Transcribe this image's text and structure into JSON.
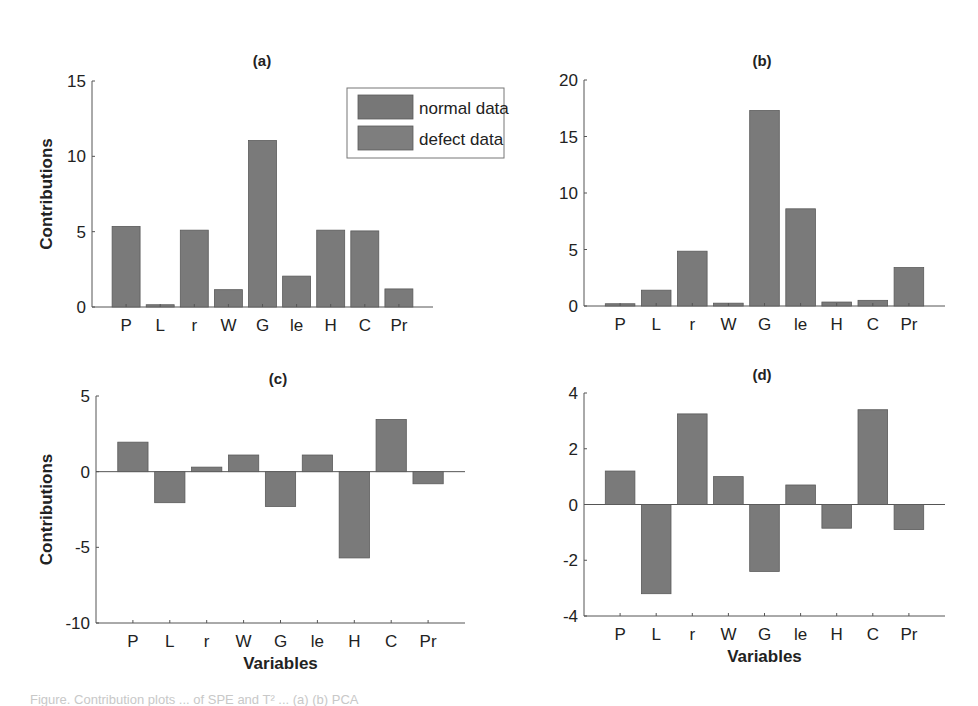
{
  "figure": {
    "bar_color": "#7a7a7a",
    "bar_edge": "#5a5a5a",
    "axis_color": "#555555",
    "caption_partial": "Figure. Contribution plots ... of SPE and T² ... (a) (b) PCA"
  },
  "legend": {
    "items": [
      {
        "label": "normal data",
        "color": "#777777"
      },
      {
        "label": "defect data",
        "color": "#7e7e7e"
      }
    ]
  },
  "chart_data": [
    {
      "type": "bar",
      "title": "(a)",
      "xlabel": "",
      "ylabel": "Contributions",
      "categories": [
        "P",
        "L",
        "r",
        "W",
        "G",
        "le",
        "H",
        "C",
        "Pr"
      ],
      "values": [
        5.35,
        0.15,
        5.1,
        1.15,
        11.05,
        2.05,
        5.1,
        5.05,
        1.2
      ],
      "ylim": [
        0,
        15
      ],
      "yticks": [
        0,
        5,
        10,
        15
      ],
      "grid": false,
      "legend": [
        "normal data",
        "defect data"
      ],
      "legend_position": "upper right"
    },
    {
      "type": "bar",
      "title": "(b)",
      "xlabel": "",
      "ylabel": "",
      "categories": [
        "P",
        "L",
        "r",
        "W",
        "G",
        "le",
        "H",
        "C",
        "Pr"
      ],
      "values": [
        0.2,
        1.4,
        4.85,
        0.25,
        17.3,
        8.6,
        0.35,
        0.5,
        3.4
      ],
      "ylim": [
        0,
        20
      ],
      "yticks": [
        0,
        5,
        10,
        15,
        20
      ],
      "grid": false
    },
    {
      "type": "bar",
      "title": "(c)",
      "xlabel": "Variables",
      "ylabel": "Contributions",
      "categories": [
        "P",
        "L",
        "r",
        "W",
        "G",
        "le",
        "H",
        "C",
        "Pr"
      ],
      "values": [
        1.95,
        -2.05,
        0.3,
        1.1,
        -2.3,
        1.1,
        -5.7,
        3.45,
        -0.8
      ],
      "ylim": [
        -10,
        5
      ],
      "yticks": [
        -10,
        -5,
        0,
        5
      ],
      "grid": false
    },
    {
      "type": "bar",
      "title": "(d)",
      "xlabel": "Variables",
      "ylabel": "",
      "categories": [
        "P",
        "L",
        "r",
        "W",
        "G",
        "le",
        "H",
        "C",
        "Pr"
      ],
      "values": [
        1.2,
        -3.2,
        3.25,
        1.0,
        -2.4,
        0.7,
        -0.85,
        3.4,
        -0.9
      ],
      "ylim": [
        -4,
        4
      ],
      "yticks": [
        -4,
        -2,
        0,
        2,
        4
      ],
      "grid": false
    }
  ]
}
